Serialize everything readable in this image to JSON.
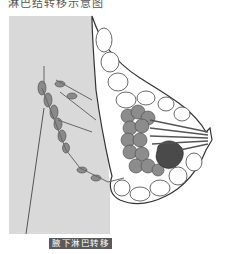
{
  "header": {
    "cut_off_text": "淋巴结转移示意图"
  },
  "figure": {
    "colors": {
      "chest_wall": "#d9d9d9",
      "fat_lobules": "#ffffff",
      "glandular_tissue": "#8c8c8c",
      "tumor": "#4a4a4a",
      "lymph_vessels": "#7a7a7a",
      "outline": "#333333"
    }
  },
  "caption": {
    "text": "腋下淋巴转移"
  }
}
